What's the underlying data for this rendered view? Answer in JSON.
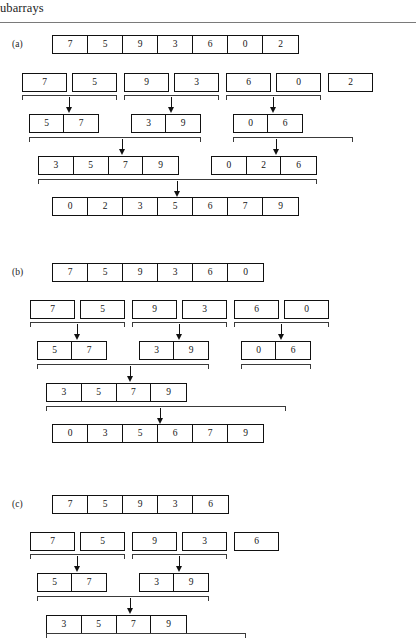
{
  "header": {
    "running_head": "ubarrays"
  },
  "panels": [
    {
      "label": "(a)",
      "rows": [
        {
          "role": "input-array",
          "arrays": [
            {
              "values": [
                "7",
                "5",
                "9",
                "3",
                "6",
                "0",
                "2"
              ]
            }
          ]
        },
        {
          "role": "split-singletons",
          "arrays": [
            {
              "values": [
                "7"
              ]
            },
            {
              "values": [
                "5"
              ]
            },
            {
              "values": [
                "9"
              ]
            },
            {
              "values": [
                "3"
              ]
            },
            {
              "values": [
                "6"
              ]
            },
            {
              "values": [
                "0"
              ]
            },
            {
              "values": [
                "2"
              ]
            }
          ]
        },
        {
          "role": "merged-pairs",
          "arrays": [
            {
              "values": [
                "5",
                "7"
              ]
            },
            {
              "values": [
                "3",
                "9"
              ]
            },
            {
              "values": [
                "0",
                "6"
              ]
            }
          ]
        },
        {
          "role": "merged-quads",
          "arrays": [
            {
              "values": [
                "3",
                "5",
                "7",
                "9"
              ]
            },
            {
              "values": [
                "0",
                "2",
                "6"
              ]
            }
          ]
        },
        {
          "role": "final-sorted",
          "arrays": [
            {
              "values": [
                "0",
                "2",
                "3",
                "5",
                "6",
                "7",
                "9"
              ]
            }
          ]
        }
      ]
    },
    {
      "label": "(b)",
      "rows": [
        {
          "role": "input-array",
          "arrays": [
            {
              "values": [
                "7",
                "5",
                "9",
                "3",
                "6",
                "0"
              ]
            }
          ]
        },
        {
          "role": "split-singletons",
          "arrays": [
            {
              "values": [
                "7"
              ]
            },
            {
              "values": [
                "5"
              ]
            },
            {
              "values": [
                "9"
              ]
            },
            {
              "values": [
                "3"
              ]
            },
            {
              "values": [
                "6"
              ]
            },
            {
              "values": [
                "0"
              ]
            }
          ]
        },
        {
          "role": "merged-pairs",
          "arrays": [
            {
              "values": [
                "5",
                "7"
              ]
            },
            {
              "values": [
                "3",
                "9"
              ]
            },
            {
              "values": [
                "0",
                "6"
              ]
            }
          ]
        },
        {
          "role": "merged-quads",
          "arrays": [
            {
              "values": [
                "3",
                "5",
                "7",
                "9"
              ]
            }
          ]
        },
        {
          "role": "final-sorted",
          "arrays": [
            {
              "values": [
                "0",
                "3",
                "5",
                "6",
                "7",
                "9"
              ]
            }
          ]
        }
      ]
    },
    {
      "label": "(c)",
      "rows": [
        {
          "role": "input-array",
          "arrays": [
            {
              "values": [
                "7",
                "5",
                "9",
                "3",
                "6"
              ]
            }
          ]
        },
        {
          "role": "split-singletons",
          "arrays": [
            {
              "values": [
                "7"
              ]
            },
            {
              "values": [
                "5"
              ]
            },
            {
              "values": [
                "9"
              ]
            },
            {
              "values": [
                "3"
              ]
            },
            {
              "values": [
                "6"
              ]
            }
          ]
        },
        {
          "role": "merged-pairs",
          "arrays": [
            {
              "values": [
                "5",
                "7"
              ]
            },
            {
              "values": [
                "3",
                "9"
              ]
            }
          ]
        },
        {
          "role": "merged-quads",
          "arrays": [
            {
              "values": [
                "3",
                "5",
                "7",
                "9"
              ]
            }
          ]
        }
      ]
    }
  ],
  "layout": {
    "cell_width": 35,
    "cell_width_small": 33,
    "row_height": 19
  },
  "colors": {
    "box_border": "#111111",
    "bracket": "#3a3a3a",
    "rule": "#7a7a7a",
    "text": "#141414",
    "background": "#ffffff"
  }
}
